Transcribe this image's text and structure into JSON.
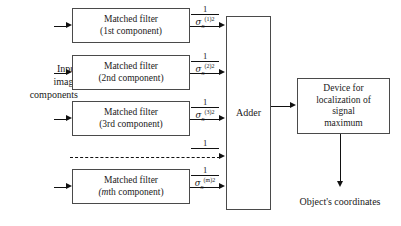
{
  "diagram": {
    "type": "block-diagram",
    "input_label": {
      "line1": "Input",
      "line2": "image",
      "line3": "components"
    },
    "filters": [
      {
        "line1": "Matched filter",
        "line2_prefix": "(1st",
        "line2_suffix": " component)",
        "weight": {
          "numerator": "1",
          "sigma": "σ",
          "subscript": "n",
          "superscript": "(1)2"
        }
      },
      {
        "line1": "Matched filter",
        "line2_prefix": "(2nd",
        "line2_suffix": " component)",
        "weight": {
          "numerator": "1",
          "sigma": "σ",
          "subscript": "n",
          "superscript": "(2)2"
        }
      },
      {
        "line1": "Matched filter",
        "line2_prefix": "(3rd",
        "line2_suffix": " component)",
        "weight": {
          "numerator": "1",
          "sigma": "σ",
          "subscript": "n",
          "superscript": "(3)2"
        }
      },
      {
        "line1": "Matched filter",
        "line2_prefix": "(m",
        "line2_suffix": "th component)",
        "weight": {
          "numerator": "1",
          "sigma": "σ",
          "subscript": "n",
          "superscript": "(m)2"
        }
      }
    ],
    "ellipsis_weight": {
      "numerator": "1"
    },
    "adder": {
      "label": "Adder"
    },
    "device": {
      "line1": "Device for",
      "line2": "localization of",
      "line3": "signal",
      "line4": "maximum"
    },
    "output_label": "Object's coordinates",
    "colors": {
      "background": "#ffffff",
      "line": "#111111",
      "box_border": "#4a4a4a",
      "text": "#1a1a1a"
    }
  }
}
